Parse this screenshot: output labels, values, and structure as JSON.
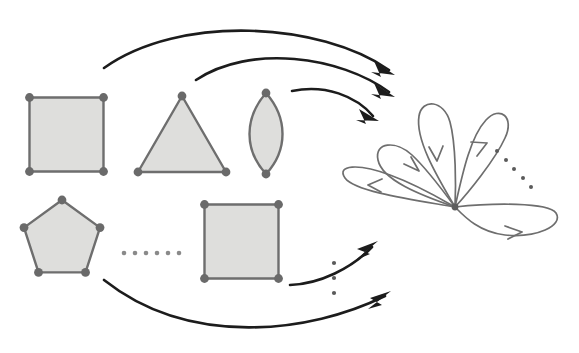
{
  "figure": {
    "background_color": "#ffffff",
    "width": 579,
    "height": 353,
    "palette": {
      "polygon_fill": "#dededc",
      "polygon_stroke": "#6e6e6e",
      "vertex_color": "#6a6a6a",
      "arrow_color": "#1c1c1c",
      "loop_color": "#6e6e6e",
      "ellipsis_color": "#8a8a8a"
    }
  },
  "diagram_data": {
    "type": "diagram",
    "description": "Directed diagram: a family of filled polygons (squares, triangle, bigon, pentagon) on the left maps via curved arrows to a rose graph (bouquet of directed loops) on the right.",
    "source_objects": [
      {
        "id": "square-top",
        "name": "square",
        "sides": 4,
        "vertices": 4,
        "row": "top",
        "center": [
          66.5,
          134.5
        ],
        "half_size": 37,
        "fill": "#dededc"
      },
      {
        "id": "triangle-top",
        "name": "triangle",
        "sides": 3,
        "vertices": 3,
        "row": "top",
        "apex": [
          182,
          96
        ],
        "base_left": [
          138,
          173
        ],
        "base_right": [
          226,
          173
        ],
        "fill": "#dededc"
      },
      {
        "id": "bigon-top",
        "name": "bigon",
        "sides": 2,
        "vertices": 2,
        "row": "top",
        "top_vertex": [
          266,
          93
        ],
        "bottom_vertex": [
          266,
          174
        ],
        "bulge": 21,
        "fill": "#dededc"
      },
      {
        "id": "pentagon-bottom",
        "name": "pentagon",
        "sides": 5,
        "vertices": 5,
        "row": "bottom",
        "center": [
          62,
          240
        ],
        "radius": 40,
        "fill": "#dededc"
      },
      {
        "id": "square-bottom",
        "name": "n-gon",
        "sides": 4,
        "vertices": 4,
        "row": "bottom",
        "center": [
          241.5,
          241.5
        ],
        "half_size": 37,
        "fill": "#dededc"
      }
    ],
    "target_object": {
      "id": "rose-graph",
      "name": "rose graph",
      "center_vertex": [
        455,
        207
      ],
      "loop_count": 5,
      "has_continuation_ellipsis": true,
      "loops": [
        {
          "index": 1,
          "direction": "up-left",
          "angle_deg": 152,
          "length": 95,
          "width": 30,
          "arrow_at": 0.55
        },
        {
          "index": 2,
          "direction": "up",
          "angle_deg": 108,
          "length": 120,
          "width": 26,
          "arrow_at": 0.52
        },
        {
          "index": 3,
          "direction": "up-right",
          "angle_deg": 72,
          "length": 120,
          "width": 26,
          "arrow_at": 0.52
        },
        {
          "index": 4,
          "direction": "left",
          "angle_deg": 186,
          "length": 122,
          "width": 30,
          "arrow_at": 0.55
        },
        {
          "index": 5,
          "direction": "right-down",
          "angle_deg": 352,
          "length": 128,
          "width": 30,
          "arrow_at": 0.55
        }
      ]
    },
    "map_arrows": [
      {
        "id": "arrow-square-top",
        "from": "square-top",
        "to": "rose-graph",
        "start": [
          104,
          68
        ],
        "tip": [
          394,
          74
        ],
        "sag": 40
      },
      {
        "id": "arrow-triangle-top",
        "from": "triangle-top",
        "to": "rose-graph",
        "start": [
          196,
          80
        ],
        "tip": [
          394,
          96
        ],
        "sag": 26
      },
      {
        "id": "arrow-bigon-top",
        "from": "bigon-top",
        "to": "rose-graph",
        "start": [
          292,
          91
        ],
        "tip": [
          378,
          120
        ],
        "sag": 14
      },
      {
        "id": "arrow-square-bottom",
        "from": "square-bottom",
        "to": "rose-graph",
        "start": [
          290,
          285
        ],
        "tip": [
          377,
          243
        ],
        "sag": 20
      },
      {
        "id": "arrow-bottom-family",
        "from": "pentagon-bottom",
        "to": "rose-graph",
        "start": [
          104,
          280
        ],
        "tip": [
          390,
          293
        ],
        "sag": 38
      }
    ],
    "ellipses": [
      {
        "id": "ellipsis-between-bottom-shapes",
        "orientation": "horizontal",
        "dot_count": 6,
        "from": [
          124,
          253
        ],
        "to": [
          180,
          253
        ],
        "meaning": "more polygons in the family"
      },
      {
        "id": "ellipsis-between-bottom-arrows",
        "orientation": "vertical",
        "dot_count": 3,
        "from": [
          334,
          263
        ],
        "to": [
          334,
          293
        ],
        "meaning": "more maps into the rose"
      },
      {
        "id": "ellipsis-rose-loops",
        "orientation": "diagonal",
        "dot_count": 5,
        "from": [
          497,
          151
        ],
        "to": [
          531,
          186
        ],
        "meaning": "more loops on the rose"
      }
    ]
  }
}
